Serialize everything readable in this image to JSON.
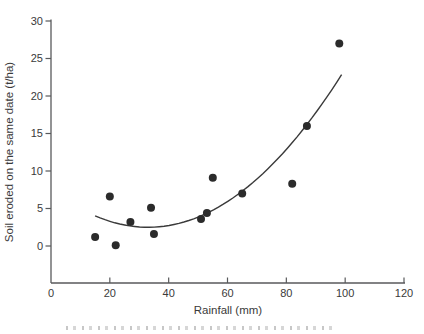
{
  "chart_data": {
    "type": "scatter",
    "title": "",
    "xlabel": "Rainfall (mm)",
    "ylabel": "Soil eroded on the same date (t/ha)",
    "xlim": [
      0,
      120
    ],
    "ylim": [
      0,
      30
    ],
    "x_ticks": [
      0,
      20,
      40,
      60,
      80,
      100,
      120
    ],
    "y_ticks": [
      0,
      5,
      10,
      15,
      20,
      25,
      30
    ],
    "grid": false,
    "legend": "none",
    "points": [
      {
        "x": 15,
        "y": 1.2
      },
      {
        "x": 20,
        "y": 6.6
      },
      {
        "x": 22,
        "y": 0.1
      },
      {
        "x": 27,
        "y": 3.2
      },
      {
        "x": 34,
        "y": 5.1
      },
      {
        "x": 35,
        "y": 1.6
      },
      {
        "x": 51,
        "y": 3.6
      },
      {
        "x": 53,
        "y": 4.4
      },
      {
        "x": 55,
        "y": 9.1
      },
      {
        "x": 65,
        "y": 7.0
      },
      {
        "x": 82,
        "y": 8.3
      },
      {
        "x": 87,
        "y": 16.0
      },
      {
        "x": 98,
        "y": 27.0
      }
    ],
    "trend_curve": {
      "type": "quadratic",
      "equation_form": "y = vy + a*(x - vx)^2",
      "a": 0.0047,
      "vx": 33,
      "vy": 2.5,
      "x_start": 15,
      "x_end": 98.8
    },
    "colors": {
      "point": "#2b2b2b",
      "curve": "#3a3a3a",
      "axis": "#58595b",
      "text": "#3a3a3a"
    }
  },
  "footer_fragment": {
    "description": "top edge of a cropped caption line, illegible"
  }
}
